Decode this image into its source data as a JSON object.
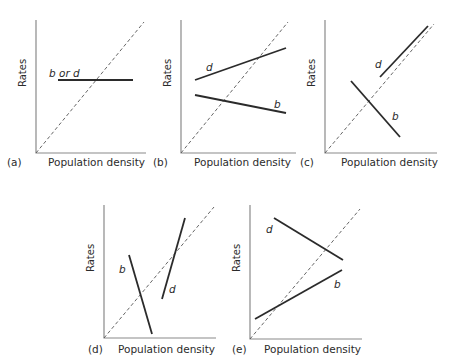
{
  "figure": {
    "y_axis_label": "Rates",
    "x_axis_label": "Population density",
    "diagonal_style": "dashed",
    "colors": {
      "axis": "#8a8a8a",
      "lines": "#2b2b2b",
      "text": "#2b2b2b"
    }
  },
  "panels": [
    {
      "id": "a",
      "label": "(a)",
      "lines": [
        {
          "name": "b or d",
          "label": "b or d",
          "trend": "flat"
        }
      ]
    },
    {
      "id": "b",
      "label": "(b)",
      "lines": [
        {
          "name": "d",
          "label": "d",
          "trend": "increasing"
        },
        {
          "name": "b",
          "label": "b",
          "trend": "decreasing"
        }
      ]
    },
    {
      "id": "c",
      "label": "(c)",
      "lines": [
        {
          "name": "d",
          "label": "d",
          "trend": "increasing steeply"
        },
        {
          "name": "b",
          "label": "b",
          "trend": "decreasing steeply"
        }
      ]
    },
    {
      "id": "d",
      "label": "(d)",
      "lines": [
        {
          "name": "b",
          "label": "b",
          "trend": "decreasing steeply"
        },
        {
          "name": "d",
          "label": "d",
          "trend": "increasing steeply"
        }
      ]
    },
    {
      "id": "e",
      "label": "(e)",
      "lines": [
        {
          "name": "d",
          "label": "d",
          "trend": "decreasing"
        },
        {
          "name": "b",
          "label": "b",
          "trend": "increasing"
        }
      ]
    }
  ]
}
